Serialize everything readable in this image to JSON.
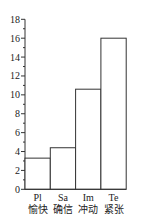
{
  "chart_data": {
    "type": "bar",
    "title": "",
    "xlabel": "",
    "ylabel": "",
    "categories": [
      "Pl",
      "Sa",
      "Im",
      "Te"
    ],
    "category_sublabels": [
      "愉快",
      "确信",
      "冲动",
      "紧张"
    ],
    "values": [
      3.3,
      4.4,
      10.6,
      16
    ],
    "ylim": [
      0,
      18
    ],
    "yticks": [
      0,
      2,
      4,
      6,
      8,
      10,
      12,
      14,
      16,
      18
    ],
    "minor_tick_step": 1,
    "grid": false,
    "legend": null,
    "bar_fill": "#ffffff",
    "bar_stroke": "#333333"
  }
}
